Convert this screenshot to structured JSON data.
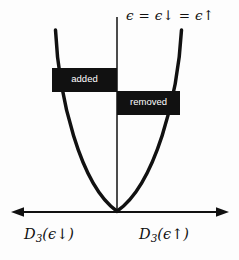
{
  "figure": {
    "name": "stoner-band-splitting-diagram",
    "background_color": "#fdfdfd",
    "ink_color": "#111111",
    "box_fill_color": "#111111",
    "box_text_color": "#ffffff"
  },
  "labels": {
    "fermi_level": "ϵ = ϵ↓ = ϵ↑",
    "fermi_level_parts": {
      "epsilon": "ϵ",
      "equals": "=",
      "epsilon_down": "ϵ↓",
      "epsilon_up": "ϵ↑"
    },
    "dos_down": "D₃(ϵ↓)",
    "dos_up": "D₃(ϵ↑)",
    "dos_symbol": "D",
    "dos_subscript": "3",
    "added_box": "added",
    "removed_box": "removed"
  },
  "chart_data": {
    "type": "line",
    "title": "",
    "xlabel": "",
    "ylabel": "",
    "axes": {
      "horizontal_axis": {
        "name": "density-of-states-axis",
        "double_headed": true,
        "y_position": 212,
        "x_start": 12,
        "x_end": 228,
        "left_label": "D₃(ϵ↓)",
        "right_label": "D₃(ϵ↑)"
      },
      "vertical_axis": {
        "name": "fermi-energy-line",
        "x_position": 117,
        "y_top": 17,
        "y_bottom": 212,
        "label": "ϵ = ϵ↓ = ϵ↑"
      }
    },
    "curve": {
      "name": "parabolic-dos-curve",
      "shape": "parabola",
      "vertex": [
        117,
        212
      ],
      "left_arm_top": [
        55,
        30
      ],
      "right_arm_top": [
        181,
        30
      ],
      "stroke_width": 3.4
    },
    "regions": [
      {
        "name": "added",
        "label": "added",
        "side": "spin-down",
        "x": 52,
        "y": 68,
        "width": 65,
        "height": 24,
        "fill": "#111111"
      },
      {
        "name": "removed",
        "label": "removed",
        "side": "spin-up",
        "x": 117,
        "y": 91,
        "width": 63,
        "height": 24,
        "fill": "#111111"
      }
    ]
  }
}
